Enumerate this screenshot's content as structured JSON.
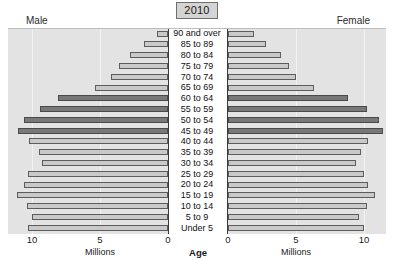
{
  "header": {
    "year": "2010",
    "male_label": "Male",
    "female_label": "Female"
  },
  "axis": {
    "center_title": "Age",
    "left_unit": "Millions",
    "right_unit": "Millions",
    "left_ticks": [
      "10",
      "5",
      "0"
    ],
    "right_ticks": [
      "0",
      "5",
      "10"
    ]
  },
  "colors": {
    "plot_background": "#e3e3e3",
    "bar_light": "#c9c9c9",
    "bar_dark": "#787878",
    "bar_outline": "#5c5c5c",
    "center_band": "#ffffff",
    "gridline": "#f2f2f2",
    "chip_fill": "#d4d4d4"
  },
  "chart_data": {
    "type": "bar",
    "subtype": "population-pyramid",
    "title": "2010",
    "xlabel": "Millions",
    "ylabel": "Age",
    "categories": [
      "90 and over",
      "85 to 89",
      "80 to 84",
      "75 to 79",
      "70 to 74",
      "65 to 69",
      "60 to 64",
      "55 to 59",
      "50 to 54",
      "45 to 49",
      "40 to 44",
      "35 to 39",
      "30 to 34",
      "25 to 29",
      "20 to 24",
      "15 to 19",
      "10 to 14",
      "5 to 9",
      "Under 5"
    ],
    "series": [
      {
        "name": "Male",
        "side": "left",
        "values": [
          0.8,
          1.8,
          2.8,
          3.6,
          4.2,
          5.4,
          8.1,
          9.4,
          10.6,
          11.0,
          10.2,
          9.5,
          9.3,
          10.3,
          10.6,
          11.1,
          10.4,
          10.0,
          10.3
        ]
      },
      {
        "name": "Female",
        "side": "right",
        "values": [
          1.9,
          2.8,
          3.9,
          4.5,
          5.0,
          6.3,
          8.8,
          10.2,
          11.1,
          11.4,
          10.3,
          9.8,
          9.4,
          10.0,
          10.3,
          10.8,
          10.2,
          9.6,
          10.0
        ]
      }
    ],
    "highlighted_categories": [
      "60 to 64",
      "55 to 59",
      "50 to 54",
      "45 to 49"
    ],
    "xlim": [
      0,
      12.5
    ],
    "tick_values": [
      0,
      5,
      10
    ],
    "grid": true,
    "legend": "none"
  }
}
